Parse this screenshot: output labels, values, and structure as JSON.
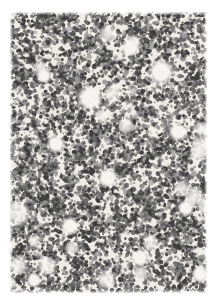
{
  "document": {
    "kind": "scanned-texture-plate",
    "title": "Speckle Texture Plate",
    "canvas_width": 215,
    "canvas_height": 297,
    "page_background": "#ffffff"
  },
  "figure": {
    "name": "speckle-texture",
    "left": 10,
    "top": 12,
    "width": 197,
    "height": 281,
    "background_color": "#efece6",
    "speckle_dark_color": "#3c3c3c",
    "speckle_mid_color": "#6a6a6a",
    "speckle_light_color": "#9a9a9a",
    "void_color": "#f6f4f0",
    "speckle_count": 5200,
    "speckle_min_radius": 0.7,
    "speckle_max_radius": 2.1,
    "void_count": 26,
    "void_min_radius": 4,
    "void_max_radius": 13,
    "grain_overlay_count": 9000,
    "random_seed": 20240517,
    "edge_fade_px": 3,
    "coverage_fraction": 0.52
  },
  "margins": {
    "top": 12,
    "right": 8,
    "bottom": 4,
    "left": 10
  },
  "light_patches": [
    {
      "cx": 80,
      "cy": 86,
      "rx": 13,
      "ry": 14
    },
    {
      "cx": 151,
      "cy": 60,
      "rx": 14,
      "ry": 13
    },
    {
      "cx": 120,
      "cy": 36,
      "rx": 10,
      "ry": 8
    },
    {
      "cx": 46,
      "cy": 132,
      "rx": 10,
      "ry": 9
    },
    {
      "cx": 168,
      "cy": 120,
      "rx": 9,
      "ry": 10
    },
    {
      "cx": 98,
      "cy": 166,
      "rx": 11,
      "ry": 9
    },
    {
      "cx": 60,
      "cy": 214,
      "rx": 9,
      "ry": 10
    },
    {
      "cx": 176,
      "cy": 196,
      "rx": 8,
      "ry": 9
    },
    {
      "cx": 130,
      "cy": 246,
      "rx": 10,
      "ry": 8
    },
    {
      "cx": 34,
      "cy": 64,
      "rx": 8,
      "ry": 8
    },
    {
      "cx": 190,
      "cy": 262,
      "rx": 8,
      "ry": 9
    },
    {
      "cx": 24,
      "cy": 268,
      "rx": 8,
      "ry": 8
    }
  ],
  "chart_data": {
    "type": "heatmap",
    "xlabel": "",
    "ylabel": "",
    "grid": false,
    "legend": "none",
    "field_width_px": 197,
    "field_height_px": 281,
    "value_range": [
      0,
      1
    ],
    "mean_coverage": 0.52,
    "particle_size_px": [
      1,
      3
    ],
    "tones": [
      "#3c3c3c",
      "#6a6a6a",
      "#9a9a9a",
      "#efece6",
      "#f6f4f0"
    ]
  }
}
